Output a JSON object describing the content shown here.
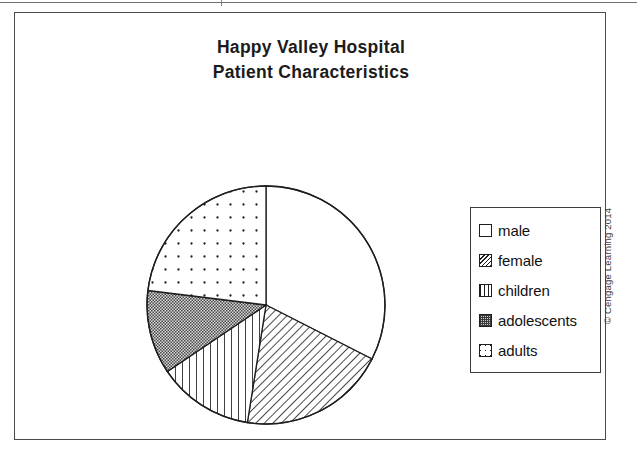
{
  "figure": {
    "title_line_1": "Happy Valley Hospital",
    "title_line_2": "Patient Characteristics",
    "copyright": "© Cengage Learning 2014"
  },
  "legend": {
    "items": [
      {
        "label": "male",
        "pattern": "blank",
        "swatch_name": "legend-swatch-male"
      },
      {
        "label": "female",
        "pattern": "diag",
        "swatch_name": "legend-swatch-female"
      },
      {
        "label": "children",
        "pattern": "vert",
        "swatch_name": "legend-swatch-children"
      },
      {
        "label": "adolescents",
        "pattern": "dense",
        "swatch_name": "legend-swatch-adolescents"
      },
      {
        "label": "adults",
        "pattern": "sparse",
        "swatch_name": "legend-swatch-adults"
      }
    ]
  },
  "chart_data": {
    "type": "pie",
    "title": "Happy Valley Hospital Patient Characteristics",
    "xlabel": "",
    "ylabel": "",
    "grid": false,
    "legend_position": "right",
    "start_angle_deg": 0,
    "direction": "clockwise",
    "labels": [
      "male",
      "female",
      "children",
      "adolescents",
      "adults"
    ],
    "values": [
      32.5,
      20.0,
      13.0,
      11.5,
      23.0
    ],
    "units": "percent",
    "slices": [
      {
        "label": "male",
        "value": 32.5,
        "start_deg": 0.0,
        "end_deg": 117.0,
        "fill": "white",
        "pattern": "blank"
      },
      {
        "label": "female",
        "value": 20.0,
        "start_deg": 117.0,
        "end_deg": 189.0,
        "fill": "white",
        "pattern": "diagonal-hatch"
      },
      {
        "label": "children",
        "value": 13.0,
        "start_deg": 189.0,
        "end_deg": 236.0,
        "fill": "white",
        "pattern": "vertical-lines"
      },
      {
        "label": "adolescents",
        "value": 11.5,
        "start_deg": 236.0,
        "end_deg": 277.0,
        "fill": "gray",
        "pattern": "dense-dotted"
      },
      {
        "label": "adults",
        "value": 23.0,
        "start_deg": 277.0,
        "end_deg": 360.0,
        "fill": "white",
        "pattern": "sparse-dots"
      }
    ],
    "colors": {
      "outline": "#1e1e1e",
      "adolescents_fill": "#b8b8b8",
      "frame": "#4a4a4a",
      "title_text": "#1b1b1b"
    }
  }
}
